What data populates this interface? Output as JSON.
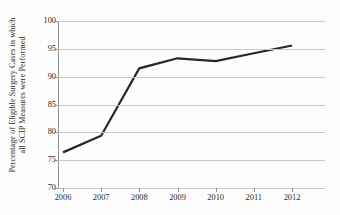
{
  "chart_data": {
    "type": "line",
    "title": "",
    "xlabel": "",
    "ylabel": "Percentage of Eligible Surgery Cases in which all SCIP Measures were Performed",
    "ylabel_lines": [
      "Percentage of Eligible Surgery Cases in which",
      "all SCIP Measures were Performed"
    ],
    "categories": [
      "2006",
      "2007",
      "2008",
      "2009",
      "2010",
      "2011",
      "2012"
    ],
    "x": [
      2006,
      2007,
      2008,
      2009,
      2010,
      2011,
      2012
    ],
    "values": [
      76.4,
      79.4,
      91.5,
      93.3,
      92.8,
      94.2,
      95.6
    ],
    "series": [
      {
        "name": "Percentage of Eligible Surgery Cases in which all SCIP Measures were Performed",
        "values": [
          76.4,
          79.4,
          91.5,
          93.3,
          92.8,
          94.2,
          95.6
        ]
      }
    ],
    "ylim": [
      70,
      100
    ],
    "yticks": [
      70,
      75,
      80,
      85,
      90,
      95,
      100
    ],
    "ytick_labels": [
      "70",
      "75",
      "80",
      "85",
      "90",
      "95",
      "100"
    ],
    "xticks": [
      2006,
      2007,
      2008,
      2009,
      2010,
      2011,
      2012
    ],
    "xtick_labels": [
      "2006",
      "2007",
      "2008",
      "2009",
      "2010",
      "2011",
      "2012"
    ],
    "grid": "horizontal",
    "legend": "none",
    "markers": false,
    "colors": {
      "line": "#262626",
      "gridline": "#c9c9c9",
      "axis": "#8e8e8e",
      "text": "#2b2b2b",
      "background": "#fdfdfd"
    },
    "line_width": 2.2
  }
}
